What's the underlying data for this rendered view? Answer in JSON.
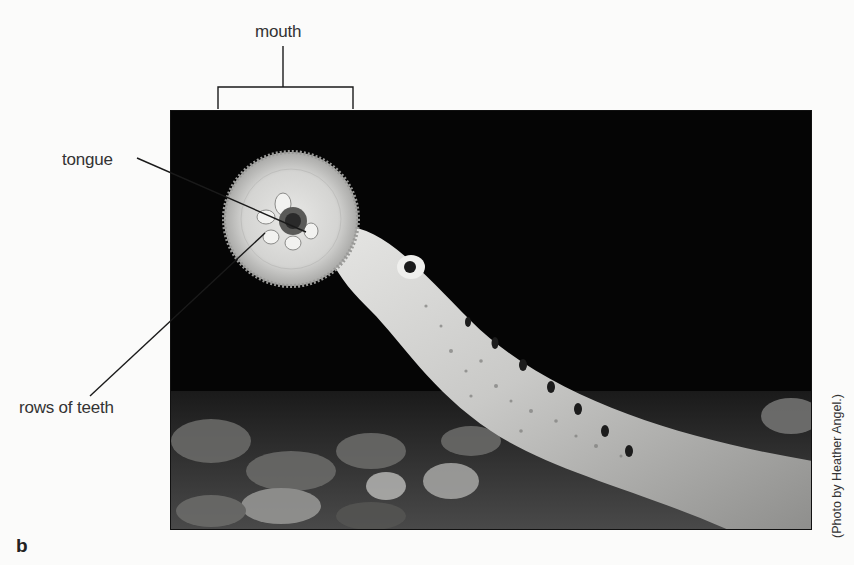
{
  "figure": {
    "panel_label": "b",
    "photo_credit": "(Photo by Heather Angel.)",
    "labels": {
      "mouth": "mouth",
      "tongue": "tongue",
      "rows_of_teeth": "rows of teeth"
    },
    "colors": {
      "background": "#050505",
      "page": "#fbfbfa",
      "leader_line": "#1a1a1a"
    }
  }
}
